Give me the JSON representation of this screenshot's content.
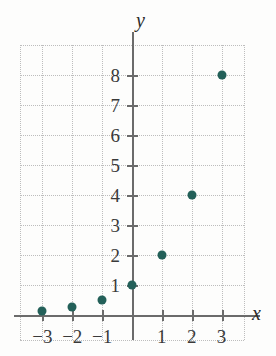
{
  "chart_data": {
    "type": "scatter",
    "title": "",
    "subtitle": "",
    "xlabel": "x",
    "ylabel": "y",
    "xlim": [
      -3.75,
      3.75
    ],
    "ylim": [
      -0.85,
      9.0
    ],
    "grid": true,
    "legend": null,
    "x_ticks": [
      -3,
      -2,
      -1,
      1,
      2,
      3
    ],
    "x_tick_labels": [
      "−3",
      "−2",
      "−1",
      "1",
      "2",
      "3"
    ],
    "y_ticks": [
      1,
      2,
      3,
      4,
      5,
      6,
      7,
      8
    ],
    "y_tick_labels": [
      "1",
      "2",
      "3",
      "4",
      "5",
      "6",
      "7",
      "8"
    ],
    "marker_color": "#236059",
    "axis_color": "#6b6b6b",
    "grid_color": "#bdbdbd",
    "background_color": "#fdfdfc",
    "points": [
      {
        "x": -3,
        "y": 0.125
      },
      {
        "x": -2,
        "y": 0.25
      },
      {
        "x": -1,
        "y": 0.5
      },
      {
        "x": 0,
        "y": 1
      },
      {
        "x": 1,
        "y": 2
      },
      {
        "x": 2,
        "y": 4
      },
      {
        "x": 3,
        "y": 8
      }
    ],
    "series": [
      {
        "name": "y = 2^x",
        "x": [
          -3,
          -2,
          -1,
          0,
          1,
          2,
          3
        ],
        "values": [
          0.125,
          0.25,
          0.5,
          1,
          2,
          4,
          8
        ]
      }
    ]
  }
}
